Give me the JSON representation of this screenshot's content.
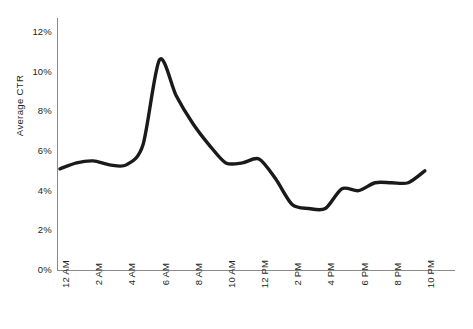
{
  "chart_data": {
    "type": "line",
    "title": "",
    "xlabel": "",
    "ylabel": "Average CTR",
    "ylim": [
      0,
      12
    ],
    "ytick_labels": [
      "12%",
      "10%",
      "8%",
      "6%",
      "4%",
      "2%",
      "0%"
    ],
    "ytick_values": [
      12,
      10,
      8,
      6,
      4,
      2,
      0
    ],
    "grid": false,
    "legend": "none",
    "x_tick_labels": [
      "12 AM",
      "2 AM",
      "4 AM",
      "6 AM",
      "8 AM",
      "10 AM",
      "12 PM",
      "2 PM",
      "4 PM",
      "6 PM",
      "8 PM",
      "10 PM"
    ],
    "x_tick_hours": [
      0,
      2,
      4,
      6,
      8,
      10,
      12,
      14,
      16,
      18,
      20,
      22
    ],
    "x": [
      "12 AM",
      "1 AM",
      "2 AM",
      "3 AM",
      "4 AM",
      "5 AM",
      "6 AM",
      "7 AM",
      "8 AM",
      "9 AM",
      "10 AM",
      "11 AM",
      "12 PM",
      "1 PM",
      "2 PM",
      "3 PM",
      "4 PM",
      "5 PM",
      "6 PM",
      "7 PM",
      "8 PM",
      "9 PM",
      "10 PM"
    ],
    "hours": [
      0,
      1,
      2,
      3,
      4,
      5,
      6,
      7,
      8,
      9,
      10,
      11,
      12,
      13,
      14,
      15,
      16,
      17,
      18,
      19,
      20,
      21,
      22
    ],
    "series": [
      {
        "name": "Average CTR",
        "color": "#1a1a1a",
        "line_width": 3.4,
        "values": [
          5.1,
          5.4,
          5.5,
          5.3,
          5.3,
          6.3,
          10.6,
          8.8,
          7.4,
          6.3,
          5.4,
          5.4,
          5.6,
          4.6,
          3.3,
          3.1,
          3.1,
          4.1,
          4.0,
          4.4,
          4.4,
          4.4,
          5.0
        ]
      }
    ],
    "peak": {
      "hour": "6 AM",
      "value": 10.6
    },
    "trough": {
      "hour": "3 PM",
      "value": 3.1
    }
  },
  "style": {
    "background": "#ffffff",
    "axis_color": "#8a8a8a",
    "text_color": "#231f20",
    "line_color": "#1a1a1a"
  }
}
